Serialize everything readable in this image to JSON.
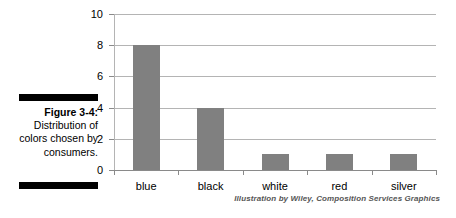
{
  "figure": {
    "caption_label": "Figure 3-4:",
    "caption_body": "Distribution of colors chosen by consumers.",
    "attribution": "Illustration by Wiley, Composition Services Graphics"
  },
  "colors": {
    "bar_fill": "#808080",
    "gridline": "#b4b4b4",
    "axis": "#8a8a8a",
    "text": "#000000",
    "rule": "#000000",
    "attribution_text": "#555555"
  },
  "chart_data": {
    "type": "bar",
    "title": "",
    "xlabel": "",
    "ylabel": "",
    "categories": [
      "blue",
      "black",
      "white",
      "red",
      "silver"
    ],
    "values": [
      8,
      4,
      1,
      1,
      1
    ],
    "ylim": [
      0,
      10
    ],
    "yticks": [
      0,
      2,
      4,
      6,
      8,
      10
    ],
    "ytick_labels": [
      "0",
      "2",
      "4",
      "6",
      "8",
      "10"
    ],
    "grid": true,
    "legend": false,
    "legend_position": "none"
  }
}
